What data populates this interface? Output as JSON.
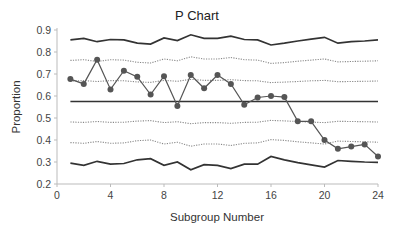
{
  "chart_data": {
    "type": "line",
    "title": "P Chart",
    "xlabel": "Subgroup Number",
    "ylabel": "Proportion",
    "xlim": [
      0,
      24
    ],
    "ylim": [
      0.2,
      0.9
    ],
    "xticks": [
      0,
      4,
      8,
      12,
      16,
      20,
      24
    ],
    "yticks": [
      0.2,
      0.3,
      0.4,
      0.5,
      0.6,
      0.7,
      0.8,
      0.9
    ],
    "grid": false,
    "legend": null,
    "x": [
      1,
      2,
      3,
      4,
      5,
      6,
      7,
      8,
      9,
      10,
      11,
      12,
      13,
      14,
      15,
      16,
      17,
      18,
      19,
      20,
      21,
      22,
      23,
      24
    ],
    "series": [
      {
        "name": "Proportion",
        "style": "line-markers",
        "values": [
          0.677,
          0.655,
          0.765,
          0.63,
          0.715,
          0.687,
          0.607,
          0.69,
          0.555,
          0.695,
          0.635,
          0.695,
          0.655,
          0.56,
          0.593,
          0.6,
          0.595,
          0.485,
          0.485,
          0.4,
          0.36,
          0.37,
          0.38,
          0.325
        ]
      },
      {
        "name": "Center Line",
        "style": "solid",
        "values": [
          0.575,
          0.575,
          0.575,
          0.575,
          0.575,
          0.575,
          0.575,
          0.575,
          0.575,
          0.575,
          0.575,
          0.575,
          0.575,
          0.575,
          0.575,
          0.575,
          0.575,
          0.575,
          0.575,
          0.575,
          0.575,
          0.575,
          0.575,
          0.575
        ]
      },
      {
        "name": "UCL",
        "style": "solid",
        "values": [
          0.855,
          0.862,
          0.847,
          0.857,
          0.855,
          0.84,
          0.836,
          0.864,
          0.852,
          0.878,
          0.862,
          0.862,
          0.872,
          0.857,
          0.855,
          0.832,
          0.84,
          0.85,
          0.858,
          0.867,
          0.84,
          0.847,
          0.85,
          0.855
        ]
      },
      {
        "name": "LCL",
        "style": "solid",
        "values": [
          0.295,
          0.285,
          0.303,
          0.29,
          0.293,
          0.31,
          0.315,
          0.285,
          0.3,
          0.265,
          0.288,
          0.285,
          0.27,
          0.29,
          0.29,
          0.325,
          0.31,
          0.297,
          0.287,
          0.277,
          0.307,
          0.303,
          0.3,
          0.298
        ]
      },
      {
        "name": "Upper 2-sigma",
        "style": "dotted",
        "values": [
          0.762,
          0.765,
          0.757,
          0.765,
          0.763,
          0.753,
          0.75,
          0.768,
          0.76,
          0.778,
          0.768,
          0.768,
          0.775,
          0.765,
          0.763,
          0.748,
          0.752,
          0.758,
          0.763,
          0.768,
          0.755,
          0.757,
          0.758,
          0.76
        ]
      },
      {
        "name": "Upper 1-sigma",
        "style": "dotted",
        "values": [
          0.668,
          0.67,
          0.666,
          0.67,
          0.669,
          0.664,
          0.662,
          0.671,
          0.667,
          0.676,
          0.671,
          0.671,
          0.674,
          0.67,
          0.669,
          0.661,
          0.663,
          0.666,
          0.669,
          0.671,
          0.665,
          0.666,
          0.667,
          0.668
        ]
      },
      {
        "name": "Lower 1-sigma",
        "style": "dotted",
        "values": [
          0.482,
          0.48,
          0.484,
          0.48,
          0.481,
          0.486,
          0.488,
          0.479,
          0.483,
          0.474,
          0.479,
          0.479,
          0.476,
          0.48,
          0.481,
          0.489,
          0.487,
          0.484,
          0.481,
          0.479,
          0.485,
          0.484,
          0.483,
          0.482
        ]
      },
      {
        "name": "Lower 2-sigma",
        "style": "dotted",
        "values": [
          0.388,
          0.385,
          0.393,
          0.385,
          0.387,
          0.397,
          0.4,
          0.382,
          0.39,
          0.372,
          0.382,
          0.382,
          0.375,
          0.385,
          0.387,
          0.402,
          0.398,
          0.392,
          0.387,
          0.382,
          0.395,
          0.393,
          0.392,
          0.39
        ]
      }
    ]
  },
  "colors": {
    "data": "#555555",
    "limits": "#333333",
    "sigma": "#888888",
    "axis": "#bbbbbb"
  }
}
